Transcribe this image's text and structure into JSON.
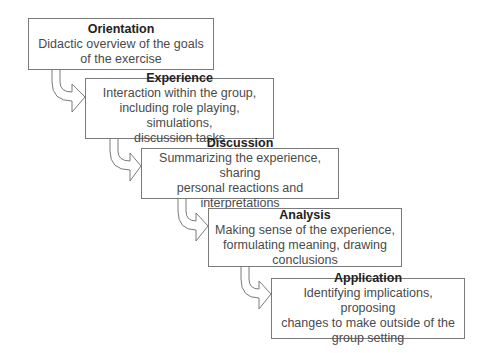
{
  "diagram": {
    "steps": [
      {
        "title": "Orientation",
        "description": "Didactic overview of the goals\nof the exercise"
      },
      {
        "title": "Experience",
        "description": "Interaction within the group,\nincluding role playing, simulations,\ndiscussion tasks"
      },
      {
        "title": "Discussion",
        "description": "Summarizing the experience, sharing\npersonal reactions and interpretations"
      },
      {
        "title": "Analysis",
        "description": "Making sense of the experience,\nformulating meaning, drawing\nconclusions"
      },
      {
        "title": "Application",
        "description": "Identifying implications, proposing\nchanges to make outside of the\ngroup setting"
      }
    ],
    "colors": {
      "border": "#7a7a7a",
      "text": "#3a3a3a",
      "background": "#ffffff"
    }
  }
}
